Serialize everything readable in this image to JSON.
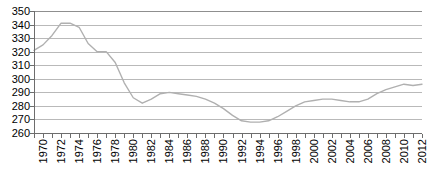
{
  "chart_data": {
    "type": "line",
    "title": "",
    "subtitle": "",
    "xlabel": "",
    "ylabel": "",
    "xlim": [
      1970,
      2013
    ],
    "ylim": [
      260,
      350
    ],
    "y_ticks": [
      350,
      340,
      330,
      320,
      310,
      300,
      290,
      280,
      270,
      260
    ],
    "y_tick_step": 10,
    "x_tick_labels": [
      "1970",
      "1972",
      "1974",
      "1976",
      "1978",
      "1980",
      "1982",
      "1984",
      "1986",
      "1988",
      "1990",
      "1992",
      "1994",
      "1996",
      "1998",
      "2000",
      "2002",
      "2004",
      "2006",
      "2008",
      "2010",
      "2012"
    ],
    "x_tick_step": 2,
    "grid": true,
    "grid_axis": "y",
    "legend": "none",
    "series": [
      {
        "name": "series-1",
        "color": "#b0b0b0",
        "line_width": 1.4,
        "x": [
          1970,
          1971,
          1972,
          1973,
          1974,
          1975,
          1976,
          1977,
          1978,
          1979,
          1980,
          1981,
          1982,
          1983,
          1984,
          1985,
          1986,
          1987,
          1988,
          1989,
          1990,
          1991,
          1992,
          1993,
          1994,
          1995,
          1996,
          1997,
          1998,
          1999,
          2000,
          2001,
          2002,
          2003,
          2004,
          2005,
          2006,
          2007,
          2008,
          2009,
          2010,
          2011,
          2012,
          2013
        ],
        "values": [
          321,
          325,
          332,
          341,
          341,
          338,
          326,
          320,
          320,
          312,
          297,
          286,
          282,
          285,
          289,
          290,
          289,
          288,
          287,
          285,
          282,
          278,
          273,
          269,
          268,
          268,
          269,
          272,
          276,
          280,
          283,
          284,
          285,
          285,
          284,
          283,
          283,
          285,
          289,
          292,
          294,
          296,
          295,
          296
        ]
      }
    ]
  },
  "axes": {
    "y_label_suffix": "",
    "x_label_rotation": "-90"
  }
}
